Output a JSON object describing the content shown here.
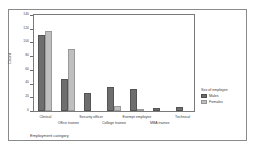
{
  "chart_data": {
    "type": "bar",
    "title": "",
    "xlabel": "Employment category",
    "ylabel": "Count",
    "ylim": [
      0,
      140
    ],
    "yticks": [
      0,
      20,
      40,
      60,
      80,
      100,
      120,
      140
    ],
    "grid": false,
    "legend": {
      "title": "Sex of employee",
      "position": "right",
      "entries": [
        "Males",
        "Females"
      ]
    },
    "categories": [
      "Clerical",
      "Office trainee",
      "Security officer",
      "College trainee",
      "Exempt employee",
      "MBA trainee",
      "Technical"
    ],
    "series": [
      {
        "name": "Males",
        "color": "#6e6e6e",
        "values": [
          111,
          47,
          27,
          35,
          32,
          4,
          6
        ]
      },
      {
        "name": "Females",
        "color": "#bfbfbf",
        "values": [
          117,
          90,
          0,
          8,
          1,
          0,
          0
        ]
      }
    ]
  }
}
